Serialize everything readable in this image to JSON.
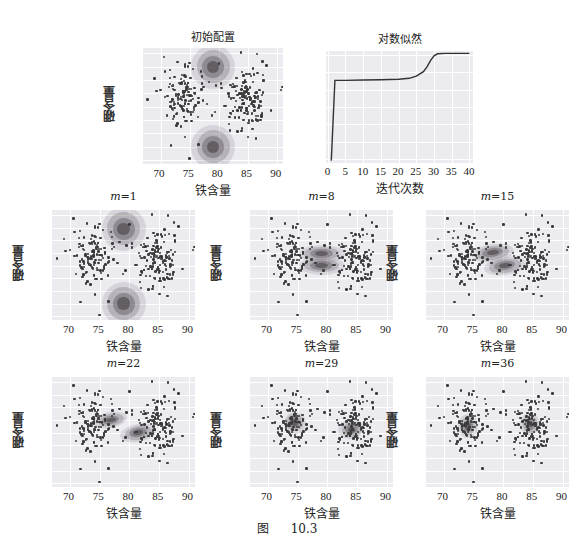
{
  "figure": {
    "caption_label": "图",
    "caption_number": "10.3"
  },
  "panels": {
    "initial": {
      "title": "初始配置",
      "xlabel": "铁含量",
      "ylabel": "硼含量"
    },
    "loglik": {
      "title": "对数似然",
      "xlabel": "迭代次数"
    },
    "m1": {
      "title_var": "m",
      "title_val": "=1",
      "xlabel": "铁含量",
      "ylabel": "硼含量"
    },
    "m8": {
      "title_var": "m",
      "title_val": "=8",
      "xlabel": "铁含量",
      "ylabel": "硼含量"
    },
    "m15": {
      "title_var": "m",
      "title_val": "=15",
      "xlabel": "铁含量",
      "ylabel": "硼含量"
    },
    "m22": {
      "title_var": "m",
      "title_val": "=22",
      "xlabel": "铁含量",
      "ylabel": "硼含量"
    },
    "m29": {
      "title_var": "m",
      "title_val": "=29",
      "xlabel": "铁含量",
      "ylabel": "硼含量"
    },
    "m36": {
      "title_var": "m",
      "title_val": "=36",
      "xlabel": "铁含量",
      "ylabel": "硼含量"
    }
  },
  "axes": {
    "scatter_xticks": [
      "70",
      "75",
      "80",
      "85",
      "90"
    ],
    "scatter_yticks": [
      "16",
      "14",
      "12",
      "10",
      "8",
      "6",
      "4",
      "2",
      "0"
    ],
    "loglik_xticks": [
      "0",
      "5",
      "10",
      "15",
      "20",
      "25",
      "30",
      "35",
      "40"
    ],
    "loglik_yticks": [
      "-1300",
      "-1350",
      "-1400",
      "-1450",
      "-1500",
      "-1550",
      "-1600"
    ]
  },
  "chart_data": [
    {
      "type": "scatter",
      "title": "初始配置",
      "xlabel": "铁含量",
      "ylabel": "硼含量",
      "xlim": [
        67,
        91
      ],
      "ylim": [
        -0.5,
        16.5
      ],
      "xticks": [
        70,
        75,
        80,
        85,
        90
      ],
      "yticks": [
        0,
        2,
        4,
        6,
        8,
        10,
        12,
        14,
        16
      ],
      "grid": true,
      "clusters": [
        {
          "name": "left cluster",
          "center": [
            74,
            9.5
          ]
        },
        {
          "name": "right cluster",
          "center": [
            84.5,
            8.5
          ]
        }
      ],
      "gaussians": [
        {
          "mean": [
            79,
            14
          ],
          "shape": "circular",
          "radius_x": 3.5
        },
        {
          "mean": [
            79,
            2
          ],
          "shape": "circular",
          "radius_x": 3.5
        }
      ]
    },
    {
      "type": "line",
      "title": "对数似然",
      "xlabel": "迭代次数",
      "ylabel": "",
      "xlim": [
        0,
        40
      ],
      "ylim": [
        -1610,
        -1290
      ],
      "xticks": [
        0,
        5,
        10,
        15,
        20,
        25,
        30,
        35,
        40
      ],
      "yticks": [
        -1300,
        -1350,
        -1400,
        -1450,
        -1500,
        -1550,
        -1600
      ],
      "grid": true,
      "x": [
        1,
        2,
        5,
        10,
        15,
        20,
        23,
        25,
        27,
        28,
        29,
        30,
        31,
        33,
        36,
        40
      ],
      "series": [
        {
          "name": "log-likelihood",
          "values": [
            -1605,
            -1373,
            -1373,
            -1372,
            -1371,
            -1370,
            -1367,
            -1361,
            -1348,
            -1334,
            -1316,
            -1302,
            -1296,
            -1295,
            -1295,
            -1295
          ]
        }
      ]
    },
    {
      "type": "scatter",
      "title": "m=1",
      "xlabel": "铁含量",
      "ylabel": "硼含量",
      "gaussians": [
        {
          "mean": [
            79,
            14
          ]
        },
        {
          "mean": [
            79,
            2
          ]
        }
      ]
    },
    {
      "type": "scatter",
      "title": "m=8",
      "xlabel": "铁含量",
      "ylabel": "硼含量",
      "gaussians": [
        {
          "mean": [
            79,
            9.8
          ],
          "shape": "elongated-x"
        },
        {
          "mean": [
            79,
            8
          ],
          "shape": "elongated-x"
        }
      ]
    },
    {
      "type": "scatter",
      "title": "m=15",
      "xlabel": "铁含量",
      "ylabel": "硼含量",
      "gaussians": [
        {
          "mean": [
            78,
            10
          ],
          "shape": "elongated-x"
        },
        {
          "mean": [
            80,
            8
          ],
          "shape": "elongated-x"
        }
      ]
    },
    {
      "type": "scatter",
      "title": "m=22",
      "xlabel": "铁含量",
      "ylabel": "硼含量",
      "gaussians": [
        {
          "mean": [
            77,
            10
          ]
        },
        {
          "mean": [
            81.5,
            8
          ]
        }
      ]
    },
    {
      "type": "scatter",
      "title": "m=29",
      "xlabel": "铁含量",
      "ylabel": "硼含量",
      "gaussians": [
        {
          "mean": [
            74.5,
            9.5
          ]
        },
        {
          "mean": [
            84,
            8.5
          ]
        }
      ]
    },
    {
      "type": "scatter",
      "title": "m=36",
      "xlabel": "铁含量",
      "ylabel": "硼含量",
      "gaussians": [
        {
          "mean": [
            74,
            9
          ]
        },
        {
          "mean": [
            84.5,
            9.2
          ]
        }
      ]
    }
  ]
}
